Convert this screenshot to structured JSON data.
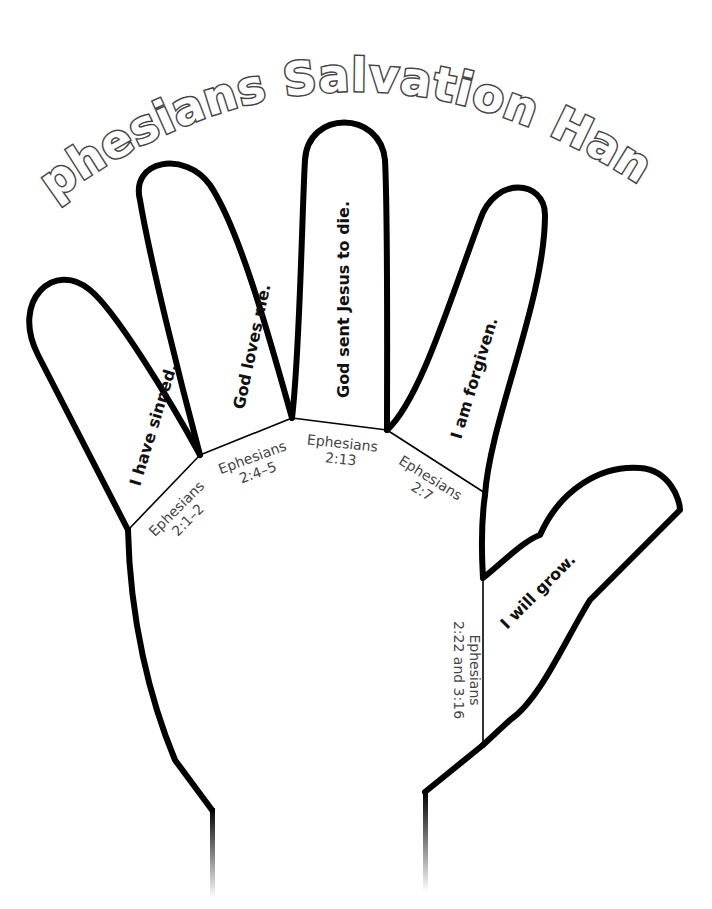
{
  "title": {
    "full": "Ephesians Salvation Hand",
    "words": [
      "Ephesians",
      "Salvation",
      "Hand"
    ]
  },
  "fingers": [
    {
      "name": "pinky",
      "statement": "I have sinned.",
      "reference": [
        "Ephesians",
        "2:1–2"
      ]
    },
    {
      "name": "ring",
      "statement": "God loves me.",
      "reference": [
        "Ephesians",
        "2:4–5"
      ]
    },
    {
      "name": "middle",
      "statement": "God sent Jesus to die.",
      "reference": [
        "Ephesians",
        "2:13"
      ]
    },
    {
      "name": "index",
      "statement": "I am forgiven.",
      "reference": [
        "Ephesians",
        "2:7"
      ]
    },
    {
      "name": "thumb",
      "statement": "I will grow.",
      "reference": [
        "Ephesians",
        "2:22 and 3:16"
      ]
    }
  ],
  "colors": {
    "outline": "#000000",
    "title_stroke": "#444444",
    "reference_text": "#444444",
    "background": "#ffffff"
  }
}
